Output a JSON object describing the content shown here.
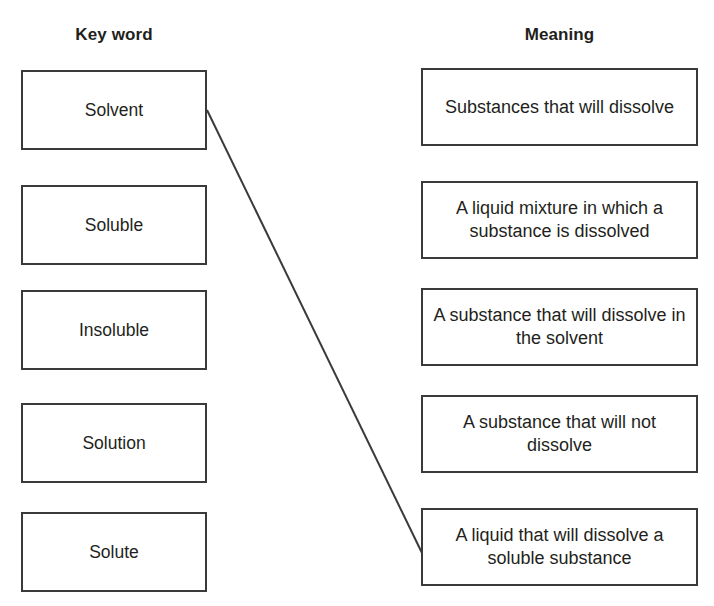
{
  "worksheet": {
    "title": "Key word and Meaning matching activity",
    "background_color": "#ffffff",
    "ink_color": "#231f20",
    "box_border_color": "#3a3a3c",
    "connector_color": "#3a3a3c"
  },
  "columns": {
    "left_heading": "Key word",
    "right_heading": "Meaning"
  },
  "key_words": [
    {
      "label": "Solvent"
    },
    {
      "label": "Soluble"
    },
    {
      "label": "Insoluble"
    },
    {
      "label": "Solution"
    },
    {
      "label": "Solute"
    }
  ],
  "meanings": [
    {
      "label": "Substances that will dissolve"
    },
    {
      "label": "A liquid mixture in which a substance is dissolved"
    },
    {
      "label": "A substance that will dissolve in the solvent"
    },
    {
      "label": "A substance that will not dissolve"
    },
    {
      "label": "A liquid that will dissolve a soluble substance"
    }
  ],
  "connections": [
    {
      "from": "Solvent",
      "to": "A liquid that will dissolve a soluble substance",
      "from_index": 0,
      "to_index": 4,
      "x1": 207,
      "y1": 110,
      "x2": 422,
      "y2": 553
    }
  ]
}
